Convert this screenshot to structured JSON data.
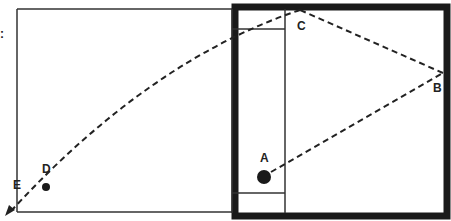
{
  "diagram": {
    "type": "court-trajectory",
    "edge_glyph": ":",
    "points": [
      {
        "id": "A",
        "label": "A",
        "x": 264,
        "y": 177,
        "marker": "large-dot"
      },
      {
        "id": "B",
        "label": "B",
        "x": 443,
        "y": 73,
        "marker": "none"
      },
      {
        "id": "C",
        "label": "C",
        "x": 300,
        "y": 10,
        "marker": "none"
      },
      {
        "id": "D",
        "label": "D",
        "x": 46,
        "y": 187,
        "marker": "small-dot"
      },
      {
        "id": "E",
        "label": "E",
        "x": 8,
        "y": 213,
        "marker": "arrow"
      }
    ],
    "path_order": [
      "A",
      "B",
      "C",
      "E"
    ],
    "colors": {
      "line": "#222222",
      "thick_border": "#1a1a1a",
      "background": "#ffffff"
    }
  }
}
